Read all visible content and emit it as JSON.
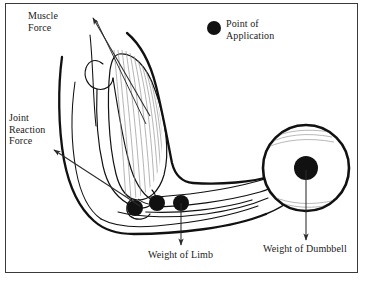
{
  "figure": {
    "type": "biomechanics-diagram",
    "background_color": "#ffffff",
    "border_color": "#3a3a3a",
    "ink_color": "#111111",
    "arrow_color": "#2b2b2b",
    "muscle_fiber_color": "#8c8c8c"
  },
  "labels": {
    "muscle_force": "Muscle\nForce",
    "muscle_force_line1": "Muscle",
    "muscle_force_line2": "Force",
    "point_of_application_line1": "Point of",
    "point_of_application_line2": "Application",
    "joint_reaction_line1": "Joint",
    "joint_reaction_line2": "Reaction",
    "joint_reaction_line3": "Force",
    "weight_of_limb": "Weight of Limb",
    "weight_of_dumbbell": "Weight of Dumbbell"
  },
  "legend": {
    "marker_shape": "filled-circle",
    "marker_color": "#111111",
    "marker_radius_px": 7,
    "marker_label_line1": "Point of",
    "marker_label_line2": "Application"
  },
  "force_vectors": [
    {
      "name": "muscle-force",
      "label": "Muscle Force",
      "origin_px": [
        148,
        112
      ],
      "tip_px": [
        92,
        17
      ],
      "direction": "up-left",
      "arrowhead_at": "tip"
    },
    {
      "name": "joint-reaction-force",
      "label": "Joint Reaction Force",
      "origin_px": [
        140,
        206
      ],
      "tip_px": [
        53,
        150
      ],
      "direction": "up-left",
      "arrowhead_at": "tip"
    },
    {
      "name": "weight-of-limb",
      "label": "Weight of Limb",
      "origin_px": [
        181,
        203
      ],
      "tip_px": [
        181,
        245
      ],
      "direction": "down",
      "arrowhead_at": "tip"
    },
    {
      "name": "weight-of-dumbbell",
      "label": "Weight of Dumbbell",
      "origin_px": [
        306,
        168
      ],
      "tip_px": [
        306,
        240
      ],
      "direction": "down",
      "arrowhead_at": "tip"
    }
  ],
  "application_points": [
    {
      "name": "joint-reaction-point",
      "cx": 135,
      "cy": 208,
      "r": 8
    },
    {
      "name": "muscle-insertion-point",
      "cx": 157,
      "cy": 203,
      "r": 8
    },
    {
      "name": "limb-center-of-gravity-point",
      "cx": 181,
      "cy": 203,
      "r": 8
    }
  ],
  "dumbbell": {
    "name": "dumbbell-plate",
    "cx": 306,
    "cy": 168,
    "outer_radius": 43,
    "center_dot_radius": 12,
    "outline_color": "#111111",
    "fill_color": "#ffffff"
  },
  "caption": ""
}
